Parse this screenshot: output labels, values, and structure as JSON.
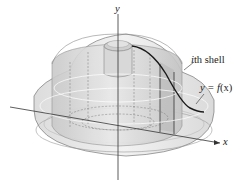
{
  "figure": {
    "type": "solid-of-revolution-shell-method",
    "labels": {
      "y_axis": "y",
      "x_axis": "x",
      "shell_var": "i",
      "shell_suffix": "th shell",
      "curve_lhs": "y = ",
      "curve_fn": "f",
      "curve_arg": "(x)"
    },
    "colors": {
      "outer_solid": "#e6e6e6",
      "inner_solid": "#d4d4d4",
      "shell": "#c8c8c8",
      "line": "#555555",
      "curve": "#1a1a1a",
      "axis": "#333333"
    }
  }
}
